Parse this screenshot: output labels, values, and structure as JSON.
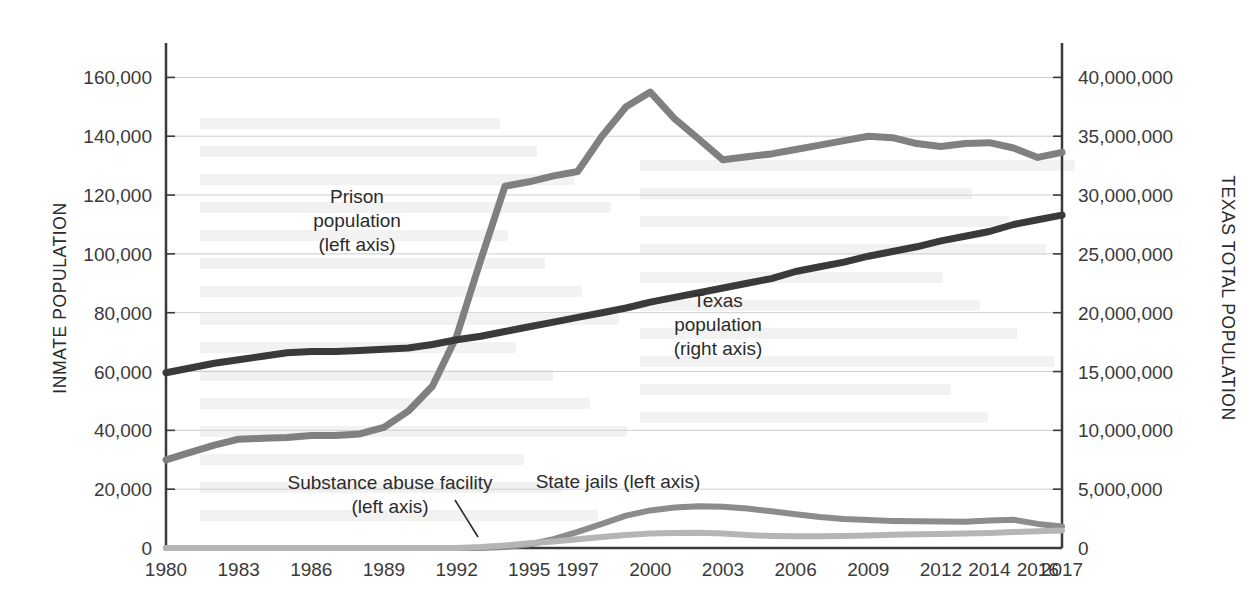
{
  "chart_data": {
    "type": "line",
    "title": "",
    "xlabel": "",
    "ylabel": "INMATE POPULATION",
    "y2label": "TEXAS TOTAL POPULATION",
    "grid": true,
    "legend_position": "inline-annotations",
    "x": [
      1980,
      1981,
      1982,
      1983,
      1984,
      1985,
      1986,
      1987,
      1988,
      1989,
      1990,
      1991,
      1992,
      1993,
      1994,
      1995,
      1996,
      1997,
      1998,
      1999,
      2000,
      2001,
      2002,
      2003,
      2004,
      2005,
      2006,
      2007,
      2008,
      2009,
      2010,
      2011,
      2012,
      2013,
      2014,
      2015,
      2016,
      2017
    ],
    "x_tick_labels": [
      "1980",
      "1983",
      "1986",
      "1989",
      "1992",
      "1995",
      "1997",
      "2000",
      "2003",
      "2006",
      "2009",
      "2012",
      "2014",
      "2016",
      "2017"
    ],
    "x_tick_values": [
      1980,
      1983,
      1986,
      1989,
      1992,
      1995,
      1997,
      2000,
      2003,
      2006,
      2009,
      2012,
      2014,
      2016,
      2017
    ],
    "ylim": [
      0,
      170000
    ],
    "y_tick_labels": [
      "0",
      "20,000",
      "40,000",
      "60,000",
      "80,000",
      "100,000",
      "120,000",
      "140,000",
      "160,000"
    ],
    "y_tick_values": [
      0,
      20000,
      40000,
      60000,
      80000,
      100000,
      120000,
      140000,
      160000
    ],
    "y2lim": [
      0,
      42500000
    ],
    "y2_tick_labels": [
      "0",
      "5,000,000",
      "10,000,000",
      "15,000,000",
      "20,000,000",
      "25,000,000",
      "30,000,000",
      "35,000,000",
      "40,000,000"
    ],
    "y2_tick_values": [
      0,
      5000000,
      10000000,
      15000000,
      20000000,
      25000000,
      30000000,
      35000000,
      40000000
    ],
    "series": [
      {
        "name": "Prison population",
        "axis": "left",
        "color": "#808080",
        "label_lines": [
          "Prison",
          "population",
          "(left axis)"
        ],
        "values": [
          30000,
          32500,
          35000,
          37000,
          37300,
          37600,
          38200,
          38300,
          38800,
          41000,
          46500,
          55000,
          72000,
          98000,
          123000,
          124500,
          126500,
          128000,
          140000,
          150000,
          155000,
          146000,
          139000,
          132000,
          133000,
          134000,
          135500,
          137000,
          138500,
          140000,
          139500,
          137500,
          136500,
          137500,
          137800,
          136000,
          132800,
          134500
        ]
      },
      {
        "name": "Texas population",
        "axis": "right",
        "color": "#3a3a3a",
        "label_lines": [
          "Texas",
          "population",
          "(right axis)"
        ],
        "values": [
          14900000,
          15300000,
          15700000,
          16000000,
          16300000,
          16600000,
          16700000,
          16700000,
          16800000,
          16900000,
          17000000,
          17300000,
          17700000,
          18000000,
          18400000,
          18800000,
          19200000,
          19600000,
          20000000,
          20400000,
          20900000,
          21300000,
          21700000,
          22100000,
          22500000,
          22900000,
          23500000,
          23900000,
          24300000,
          24800000,
          25200000,
          25600000,
          26100000,
          26500000,
          26900000,
          27500000,
          27900000,
          28300000
        ]
      },
      {
        "name": "State jails",
        "axis": "left",
        "color": "#8c8c8c",
        "label_lines": [
          "State jails (left axis)"
        ],
        "values": [
          0,
          0,
          0,
          0,
          0,
          0,
          0,
          0,
          0,
          0,
          0,
          0,
          0,
          0,
          300,
          1200,
          3000,
          5500,
          8200,
          11000,
          12800,
          13800,
          14200,
          14000,
          13400,
          12500,
          11500,
          10500,
          9900,
          9500,
          9200,
          9100,
          9000,
          8900,
          9300,
          9600,
          8200,
          7300
        ]
      },
      {
        "name": "Substance abuse facility",
        "axis": "left",
        "color": "#b5b5b5",
        "label_lines": [
          "Substance abuse facility",
          "(left axis)"
        ],
        "values": [
          0,
          0,
          0,
          0,
          0,
          0,
          0,
          0,
          0,
          0,
          0,
          0,
          0,
          300,
          900,
          1600,
          2200,
          3000,
          3700,
          4400,
          4900,
          5100,
          5200,
          4900,
          4400,
          4100,
          4000,
          4000,
          4100,
          4300,
          4500,
          4700,
          4800,
          4900,
          5100,
          5400,
          5700,
          6000
        ]
      }
    ],
    "annotations": [
      {
        "name": "substance-abuse-leader",
        "from_x": 455,
        "from_y": 500,
        "to_x": 478,
        "to_y": 537
      }
    ]
  },
  "colors": {
    "prison": "#808080",
    "texas": "#3a3a3a",
    "state_jails": "#8c8c8c",
    "substance_abuse": "#b5b5b5",
    "gridline": "#cfcfcf",
    "axis": "#3a3a3a",
    "background": "#ffffff"
  }
}
